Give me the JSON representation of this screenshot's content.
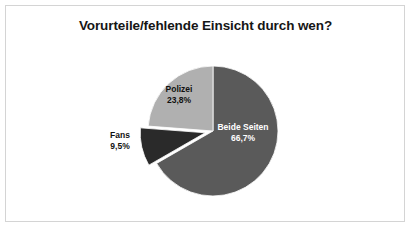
{
  "frame": {
    "border_color": "#d4d4d4",
    "background": "#ffffff"
  },
  "chart_data": {
    "type": "pie",
    "title": "Vorurteile/fehlende Einsicht durch wen?",
    "xlabel": "",
    "ylabel": "",
    "legend": "none",
    "start_angle_deg": 0,
    "direction": "clockwise",
    "categories": [
      "Beide Seiten",
      "Fans",
      "Polizei"
    ],
    "values": [
      66.7,
      9.5,
      23.8
    ],
    "value_labels": [
      "66,7%",
      "9,5%",
      "23,8%"
    ],
    "colors": [
      "#5a5a5a",
      "#2a2a2a",
      "#b0b0b0"
    ],
    "slices": [
      {
        "name": "Beide Seiten",
        "value": 66.7,
        "value_label": "66,7%",
        "color": "#5a5a5a",
        "label_color": "#ffffff",
        "label_position": "inside",
        "exploded": false
      },
      {
        "name": "Fans",
        "value": 9.5,
        "value_label": "9,5%",
        "color": "#2a2a2a",
        "label_color": "#111111",
        "label_position": "outside",
        "exploded": true
      },
      {
        "name": "Polizei",
        "value": 23.8,
        "value_label": "23,8%",
        "color": "#b0b0b0",
        "label_color": "#111111",
        "label_position": "inside",
        "exploded": false
      }
    ]
  }
}
